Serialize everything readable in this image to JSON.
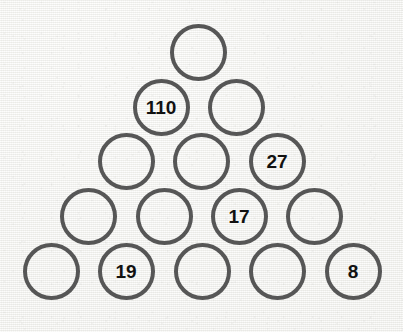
{
  "puzzle": {
    "title": "Number Pyramid",
    "type": "circle-pyramid",
    "rows": 5,
    "circle_diameter": 57,
    "row_spacing": 54.5,
    "column_spacing": 75.5,
    "colors": {
      "background": "#f3f3f1",
      "circle_stroke": "#565656",
      "label_text": "#111111"
    },
    "cells": [
      {
        "id": "r1c1",
        "row": 1,
        "col": 1,
        "value": "",
        "cx": 198,
        "cy": 52
      },
      {
        "id": "r2c1",
        "row": 2,
        "col": 1,
        "value": "110",
        "cx": 161,
        "cy": 107
      },
      {
        "id": "r2c2",
        "row": 2,
        "col": 2,
        "value": "",
        "cx": 236,
        "cy": 107
      },
      {
        "id": "r3c1",
        "row": 3,
        "col": 1,
        "value": "",
        "cx": 126,
        "cy": 161
      },
      {
        "id": "r3c2",
        "row": 3,
        "col": 2,
        "value": "",
        "cx": 201,
        "cy": 161
      },
      {
        "id": "r3c3",
        "row": 3,
        "col": 3,
        "value": "27",
        "cx": 277,
        "cy": 161
      },
      {
        "id": "r4c1",
        "row": 4,
        "col": 1,
        "value": "",
        "cx": 88,
        "cy": 216
      },
      {
        "id": "r4c2",
        "row": 4,
        "col": 2,
        "value": "",
        "cx": 164,
        "cy": 216
      },
      {
        "id": "r4c3",
        "row": 4,
        "col": 3,
        "value": "17",
        "cx": 239,
        "cy": 216
      },
      {
        "id": "r4c4",
        "row": 4,
        "col": 4,
        "value": "",
        "cx": 314,
        "cy": 216
      },
      {
        "id": "r5c1",
        "row": 5,
        "col": 1,
        "value": "",
        "cx": 51,
        "cy": 271
      },
      {
        "id": "r5c2",
        "row": 5,
        "col": 2,
        "value": "19",
        "cx": 126,
        "cy": 271
      },
      {
        "id": "r5c3",
        "row": 5,
        "col": 3,
        "value": "",
        "cx": 202,
        "cy": 271
      },
      {
        "id": "r5c4",
        "row": 5,
        "col": 4,
        "value": "",
        "cx": 277,
        "cy": 271
      },
      {
        "id": "r5c5",
        "row": 5,
        "col": 5,
        "value": "8",
        "cx": 353,
        "cy": 271
      }
    ]
  }
}
